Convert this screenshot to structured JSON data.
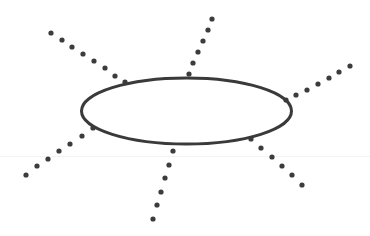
{
  "diagram": {
    "title": "",
    "stroke_color": "#3a3a3a",
    "dot_color": "#3c3c3c",
    "background": "#ffffff",
    "ellipse": {
      "cx": 186.5,
      "cy": 111,
      "rx": 105,
      "ry": 33,
      "stroke_width": 3
    },
    "dot_radius": 2.6,
    "rays": [
      {
        "name": "top-left",
        "dots": [
          [
            51,
            33
          ],
          [
            62,
            40
          ],
          [
            72,
            47
          ],
          [
            83,
            54
          ],
          [
            94,
            61
          ],
          [
            105,
            68
          ],
          [
            115,
            76
          ],
          [
            125,
            82
          ]
        ]
      },
      {
        "name": "top",
        "dots": [
          [
            212,
            19
          ],
          [
            208,
            30
          ],
          [
            203,
            41
          ],
          [
            198,
            52
          ],
          [
            193,
            63
          ],
          [
            189,
            74
          ]
        ]
      },
      {
        "name": "top-right",
        "dots": [
          [
            350,
            66
          ],
          [
            339,
            72
          ],
          [
            329,
            78
          ],
          [
            318,
            84
          ],
          [
            307,
            90
          ],
          [
            296,
            95
          ],
          [
            286,
            100
          ]
        ]
      },
      {
        "name": "bottom-right",
        "dots": [
          [
            251,
            139
          ],
          [
            261,
            148
          ],
          [
            272,
            157
          ],
          [
            282,
            166
          ],
          [
            292,
            175
          ],
          [
            302,
            185
          ]
        ]
      },
      {
        "name": "bottom",
        "dots": [
          [
            173,
            151
          ],
          [
            169,
            165
          ],
          [
            165,
            178
          ],
          [
            161,
            192
          ],
          [
            157,
            205
          ],
          [
            153,
            219
          ]
        ]
      },
      {
        "name": "bottom-left",
        "dots": [
          [
            93,
            128
          ],
          [
            82,
            136
          ],
          [
            70,
            144
          ],
          [
            59,
            151
          ],
          [
            48,
            159
          ],
          [
            37,
            166
          ],
          [
            26,
            175
          ]
        ]
      }
    ],
    "artifact_line_y": 156
  }
}
